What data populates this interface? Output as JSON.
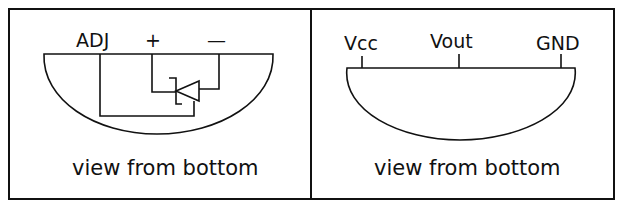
{
  "panels": [
    {
      "id": "adjustable-regulator",
      "pins": [
        "ADJ",
        "+",
        "—"
      ],
      "caption": "view from bottom"
    },
    {
      "id": "three-terminal-sensor",
      "pins": [
        "Vcc",
        "Vout",
        "GND"
      ],
      "caption": "view from bottom"
    }
  ],
  "colors": {
    "line": "#111111",
    "background": "#ffffff"
  }
}
